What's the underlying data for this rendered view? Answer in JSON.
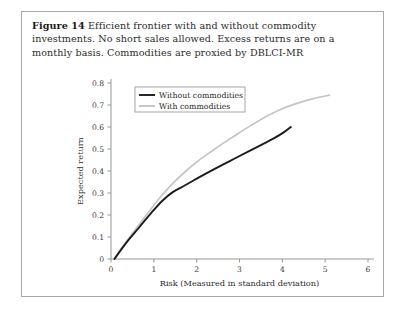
{
  "caption": {
    "label": "Figure 14",
    "text": "Efficient frontier with and without commodity investments. No short sales allowed. Excess returns are on a monthly basis. Commodities are proxied by DBLCI-MR"
  },
  "colors": {
    "without_commodities": "#1c1c1c",
    "with_commodities": "#c4c4c4",
    "axis": "#8d8d8d",
    "frame": "#a8a8a8",
    "text": "#2b2b2b",
    "background": "#ffffff"
  },
  "chart_data": {
    "type": "line",
    "title": "",
    "subtitle": "",
    "xlabel": "Risk (Measured in standard deviation)",
    "ylabel": "Expected return",
    "xlim": [
      0,
      6
    ],
    "ylim": [
      0,
      0.8
    ],
    "xticks": [
      0,
      1,
      2,
      3,
      4,
      5,
      6
    ],
    "xticklabels": [
      "0",
      "1",
      "2",
      "3",
      "4",
      "5",
      "6"
    ],
    "yticks": [
      0,
      0.1,
      0.2,
      0.3,
      0.4,
      0.5,
      0.6,
      0.7,
      0.8
    ],
    "yticklabels": [
      "0",
      "0.1",
      "0.2",
      "0.3",
      "0.4",
      "0.5",
      "0.6",
      "0.7",
      "0.8"
    ],
    "grid": false,
    "legend_position": "upper left",
    "series": [
      {
        "name": "Without commodities",
        "color": "#1c1c1c",
        "x": [
          0.08,
          0.35,
          0.65,
          0.95,
          1.2,
          1.45,
          1.7,
          2.0,
          2.3,
          2.6,
          2.9,
          3.2,
          3.5,
          3.8,
          4.05,
          4.2
        ],
        "y": [
          0.0,
          0.072,
          0.142,
          0.212,
          0.265,
          0.305,
          0.332,
          0.365,
          0.397,
          0.428,
          0.458,
          0.488,
          0.518,
          0.548,
          0.578,
          0.6
        ]
      },
      {
        "name": "With commodities",
        "color": "#c4c4c4",
        "x": [
          0.08,
          0.35,
          0.65,
          0.95,
          1.2,
          1.45,
          1.75,
          2.05,
          2.35,
          2.65,
          2.95,
          3.25,
          3.55,
          3.9,
          4.3,
          4.7,
          5.1
        ],
        "y": [
          0.0,
          0.078,
          0.155,
          0.232,
          0.292,
          0.345,
          0.4,
          0.448,
          0.49,
          0.53,
          0.568,
          0.605,
          0.64,
          0.675,
          0.705,
          0.728,
          0.745
        ]
      }
    ]
  },
  "legend": {
    "entries": [
      {
        "label": "Without commodities"
      },
      {
        "label": "With commodities"
      }
    ]
  }
}
